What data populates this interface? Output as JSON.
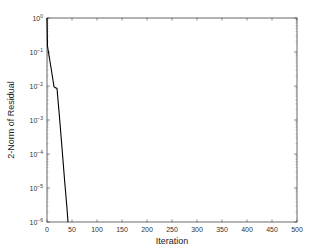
{
  "chart_data": {
    "type": "line",
    "title": "",
    "xlabel": "Iteration",
    "ylabel": "2-Norm of Residual",
    "xscale": "linear",
    "yscale": "log",
    "xlim": [
      0,
      500
    ],
    "ylim": [
      1e-06,
      1
    ],
    "grid": false,
    "legend": null,
    "x_ticks": [
      0,
      50,
      100,
      150,
      200,
      250,
      300,
      350,
      400,
      450,
      500
    ],
    "x_tick_labels": [
      "0",
      "50",
      "100",
      "150",
      "200",
      "250",
      "300",
      "350",
      "400",
      "450",
      "500"
    ],
    "y_ticks_exponents": [
      0,
      -1,
      -2,
      -3,
      -4,
      -5,
      -6
    ],
    "y_tick_labels": [
      "10^0",
      "10^-1",
      "10^-2",
      "10^-3",
      "10^-4",
      "10^-5",
      "10^-6"
    ],
    "series": [
      {
        "name": "residual",
        "color": "#000000",
        "x": [
          0,
          1,
          2,
          8,
          14,
          16,
          20,
          25,
          30,
          35,
          40,
          42
        ],
        "y": [
          1.0,
          0.15,
          0.12,
          0.035,
          0.0095,
          0.009,
          0.0085,
          0.0012,
          0.00015,
          1.8e-05,
          2.5e-06,
          1e-06
        ]
      }
    ]
  }
}
